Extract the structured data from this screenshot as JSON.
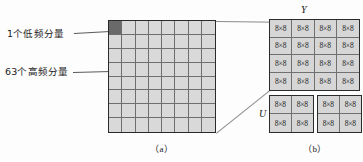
{
  "figure": {
    "panels": [
      {
        "id": "a",
        "caption": "（a）",
        "annotations": [
          {
            "name": "dc-component",
            "text": "1个低频分量"
          },
          {
            "name": "ac-component",
            "text": "63个高频分量"
          }
        ],
        "grid": {
          "rows": 8,
          "columns": 8,
          "total_cells": 64,
          "highlighted_cell_index": 0,
          "cell_fill": "#d9d9d9",
          "highlight_fill": "#6a6a6a",
          "border_color": "#2b2b2b"
        }
      },
      {
        "id": "b",
        "caption": "（b）",
        "blocks": [
          {
            "name": "y-block",
            "label": "Y",
            "rows": 4,
            "columns": 4,
            "cell_label": "8×8",
            "cell_count": 16
          },
          {
            "name": "u-block",
            "label": "U",
            "rows": 2,
            "columns": 2,
            "cell_label": "8×8",
            "cell_count": 4
          },
          {
            "name": "v-block",
            "label": "V",
            "rows": 2,
            "columns": 2,
            "cell_label": "8×8",
            "cell_count": 4
          }
        ]
      }
    ]
  }
}
